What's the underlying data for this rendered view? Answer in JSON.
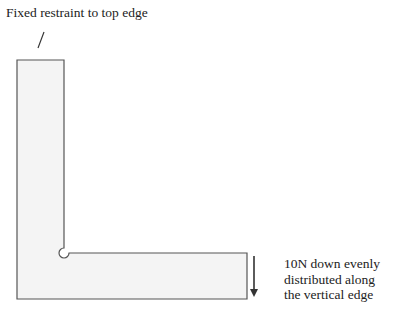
{
  "diagram": {
    "type": "L-bracket structural load diagram",
    "annotations": {
      "restraint": "Fixed restraint to top edge",
      "load_line1": "10N down evenly",
      "load_line2": "distributed along",
      "load_line3": "the vertical edge"
    },
    "load": {
      "magnitude": "10N",
      "direction": "down"
    },
    "colors": {
      "fill": "#f4f4f4",
      "stroke": "#555555",
      "arrow": "#333333"
    }
  }
}
